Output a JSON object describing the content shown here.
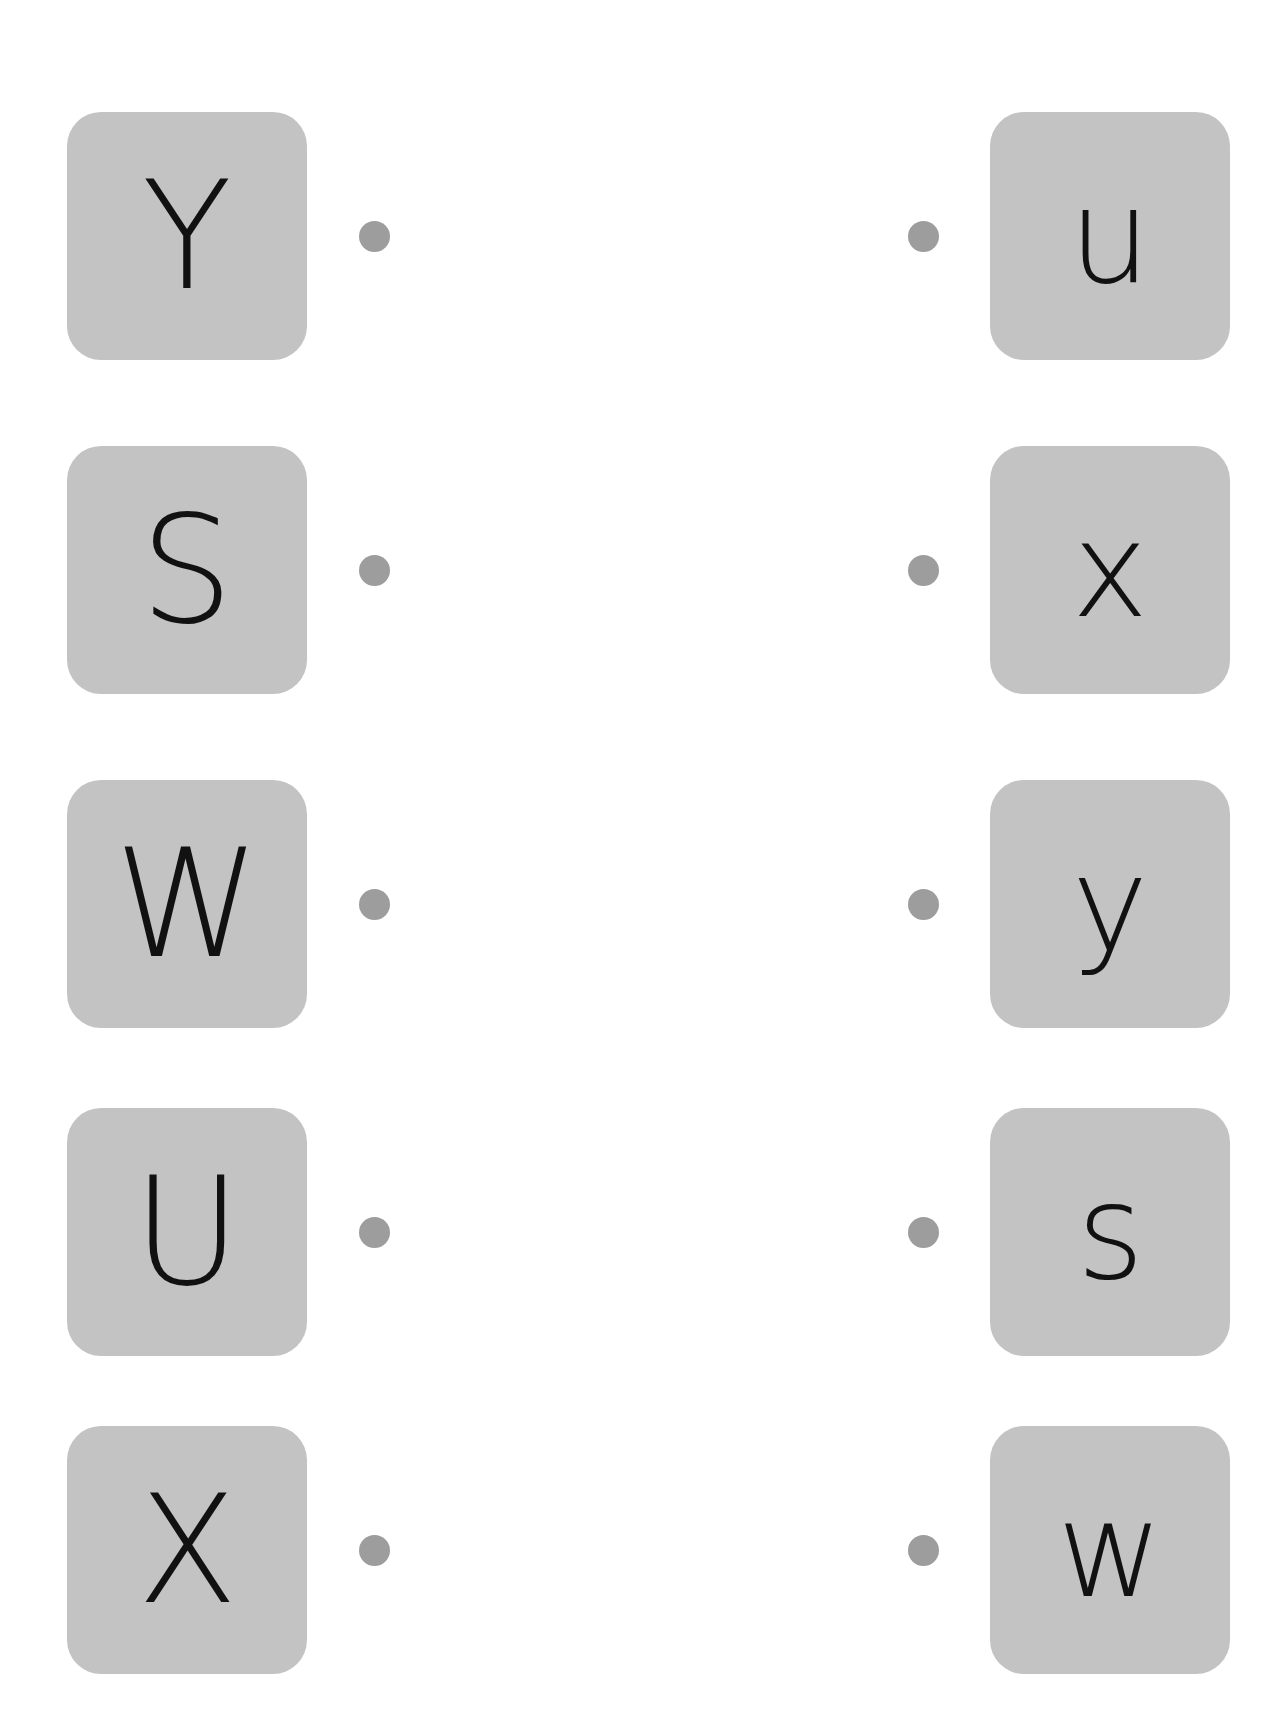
{
  "worksheet": {
    "title": "Uppercase to lowercase letter matching worksheet",
    "background_color": "#ffffff",
    "card_color": "#c3c3c3",
    "dot_color": "#9d9d9d",
    "letter_color": "#111111",
    "row_count": 5
  },
  "rows": [
    {
      "left_letter": "Y",
      "right_letter": "u",
      "left_dot": "•",
      "right_dot": "•"
    },
    {
      "left_letter": "S",
      "right_letter": "x",
      "left_dot": "•",
      "right_dot": "•"
    },
    {
      "left_letter": "W",
      "right_letter": "y",
      "left_dot": "•",
      "right_dot": "•"
    },
    {
      "left_letter": "U",
      "right_letter": "s",
      "left_dot": "•",
      "right_dot": "•"
    },
    {
      "left_letter": "X",
      "right_letter": "w",
      "left_dot": "•",
      "right_dot": "•"
    }
  ]
}
